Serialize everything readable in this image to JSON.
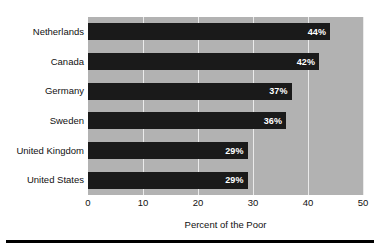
{
  "chart_data": {
    "type": "bar",
    "orientation": "horizontal",
    "title": "",
    "xlabel": "Percent of the Poor",
    "ylabel": "",
    "categories": [
      "Netherlands",
      "Canada",
      "Germany",
      "Sweden",
      "United Kingdom",
      "United States"
    ],
    "values": [
      44,
      42,
      37,
      36,
      29,
      29
    ],
    "value_labels": [
      "44%",
      "42%",
      "37%",
      "36%",
      "29%",
      "29%"
    ],
    "xlim": [
      0,
      50
    ],
    "xticks": [
      0,
      10,
      20,
      30,
      40,
      50
    ],
    "xtick_labels": [
      "0",
      "10",
      "20",
      "30",
      "40",
      "50"
    ],
    "grid": true,
    "grid_axis": "x",
    "legend": "none",
    "colors": {
      "bar": "#1a1a1a",
      "plot_background": "#b2b2b2",
      "gridline": "#ebebeb",
      "value_label": "#ffffff",
      "text": "#111111",
      "rule": "#000000"
    }
  }
}
